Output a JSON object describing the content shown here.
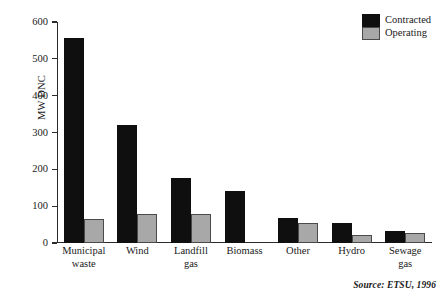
{
  "chart_data": {
    "type": "bar",
    "title": "",
    "xlabel": "",
    "ylabel": "MW DNC",
    "ylim": [
      0,
      600
    ],
    "yticks": [
      0,
      100,
      200,
      300,
      400,
      500,
      600
    ],
    "ytick_labels": [
      "0",
      "100",
      "200",
      "300",
      "400",
      "500",
      "600"
    ],
    "grid": false,
    "legend_position": "top-right",
    "categories": [
      "Municipal waste",
      "Wind",
      "Landfill gas",
      "Biomass",
      "Other",
      "Hydro",
      "Sewage gas"
    ],
    "category_lines": [
      [
        "Municipal",
        "waste"
      ],
      [
        "Wind",
        ""
      ],
      [
        "Landfill",
        "gas"
      ],
      [
        "Biomass",
        ""
      ],
      [
        "Other",
        ""
      ],
      [
        "Hydro",
        ""
      ],
      [
        "Sewage",
        "gas"
      ]
    ],
    "series": [
      {
        "name": "Contracted",
        "color": "#0f0f0f",
        "values": [
          557,
          320,
          176,
          140,
          68,
          55,
          33
        ]
      },
      {
        "name": "Operating",
        "color": "#a8a8a8",
        "values": [
          66,
          78,
          79,
          0,
          55,
          22,
          28
        ]
      }
    ]
  },
  "legend": {
    "items": [
      {
        "label": "Contracted",
        "swatch": "contracted"
      },
      {
        "label": "Operating",
        "swatch": "operating"
      }
    ]
  },
  "source": {
    "text": "Source: ETSU, 1996"
  }
}
